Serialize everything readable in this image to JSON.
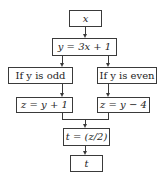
{
  "diagram": {
    "type": "flowchart",
    "nodes": [
      {
        "id": "input",
        "label": "x"
      },
      {
        "id": "compute_y",
        "label": "y = 3x + 1"
      },
      {
        "id": "odd_branch",
        "label": "If y is odd"
      },
      {
        "id": "even_branch",
        "label": "If y is even"
      },
      {
        "id": "z_odd",
        "label": "z = y + 1"
      },
      {
        "id": "z_even",
        "label": "z = y − 4"
      },
      {
        "id": "compute_t",
        "label": "t = (z/2)"
      },
      {
        "id": "output",
        "label": "t"
      }
    ],
    "edges": [
      [
        "input",
        "compute_y"
      ],
      [
        "compute_y",
        "odd_branch"
      ],
      [
        "compute_y",
        "even_branch"
      ],
      [
        "odd_branch",
        "z_odd"
      ],
      [
        "even_branch",
        "z_even"
      ],
      [
        "z_odd",
        "compute_t"
      ],
      [
        "z_even",
        "compute_t"
      ],
      [
        "compute_t",
        "output"
      ]
    ]
  },
  "colors": {
    "line": "#3a3a3a",
    "text": "#1e1e1e",
    "background": "#ffffff"
  }
}
